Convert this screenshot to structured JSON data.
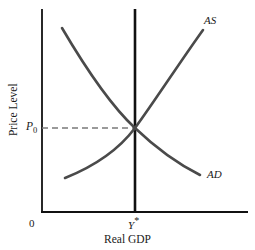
{
  "figure": {
    "type": "diagram",
    "axes": {
      "x_label": "Real GDP",
      "y_label": "Price Level",
      "origin_label": "0"
    },
    "labels": {
      "as_curve": "AS",
      "ad_curve": "AD",
      "equilibrium_price": "P",
      "equilibrium_price_sub": "0",
      "equilibrium_output": "Y",
      "equilibrium_output_star": "*"
    },
    "colors": {
      "curve": "#4a4a4a",
      "axis": "#111111",
      "vertical_line": "#111111",
      "dashed_guide": "#7a7a7a",
      "background": "#ffffff",
      "text": "#1a1a1a"
    },
    "geometry": {
      "y_axis_x": 42,
      "y_axis_top": 9,
      "x_axis_y": 212,
      "x_axis_right": 248,
      "vertical_line_x": 135,
      "vertical_line_top": 9,
      "equilibrium_point": [
        135,
        128
      ],
      "dashed_line_from_x": 42,
      "dashed_line_to_x": 135,
      "dashed_line_y": 128,
      "as_path": "M 65 178 C 95 166, 120 148, 135 128 C 152 105, 180 62, 203 30",
      "ad_path": "M 62 28 C 82 62, 108 103, 135 128 C 158 150, 182 166, 200 175"
    }
  }
}
